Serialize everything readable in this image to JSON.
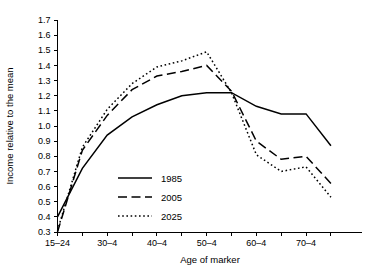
{
  "chart_data": {
    "type": "line",
    "title": "",
    "xlabel": "Age of marker",
    "ylabel": "Income relative to the mean",
    "ylim": [
      0.3,
      1.7
    ],
    "ytick_step": 0.1,
    "grid": false,
    "legend_position": "center-left",
    "categories": [
      "15–24",
      "25–9",
      "30–4",
      "35–9",
      "40–4",
      "45–9",
      "50–4",
      "55–9",
      "60–4",
      "65–9",
      "70–4",
      "75+"
    ],
    "xtick_labels": [
      "15–24",
      "30–4",
      "40–4",
      "50–4",
      "60–4",
      "70–4"
    ],
    "ytick_labels": [
      "0.3",
      "0.4",
      "0.5",
      "0.6",
      "0.7",
      "0.8",
      "0.9",
      "1.0",
      "1.1",
      "1.2",
      "1.3",
      "1.4",
      "1.5",
      "1.6",
      "1.7"
    ],
    "series": [
      {
        "name": "1985",
        "style": "solid",
        "values": [
          0.4,
          0.72,
          0.94,
          1.06,
          1.14,
          1.2,
          1.22,
          1.22,
          1.13,
          1.08,
          1.08,
          0.87
        ]
      },
      {
        "name": "2005",
        "style": "dashed",
        "values": [
          0.3,
          0.84,
          1.07,
          1.24,
          1.33,
          1.36,
          1.4,
          1.23,
          0.9,
          0.78,
          0.8,
          0.62
        ]
      },
      {
        "name": "2025",
        "style": "dotted",
        "values": [
          0.31,
          0.86,
          1.11,
          1.28,
          1.39,
          1.43,
          1.49,
          1.22,
          0.81,
          0.7,
          0.73,
          0.53
        ]
      }
    ],
    "legend_entries": [
      {
        "label": "1985",
        "style": "solid"
      },
      {
        "label": "2005",
        "style": "dashed"
      },
      {
        "label": "2025",
        "style": "dotted"
      }
    ]
  }
}
